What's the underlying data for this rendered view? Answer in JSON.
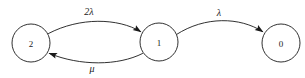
{
  "diagram": {
    "type": "state-transition-diagram",
    "title": "",
    "canvas": {
      "width": 305,
      "height": 78,
      "background": "#ffffff"
    },
    "stroke_color": "#1a1a1a",
    "nodes": [
      {
        "id": "state-2",
        "label": "2",
        "cx": 31,
        "cy": 43,
        "r": 19
      },
      {
        "id": "state-1",
        "label": "1",
        "cx": 159,
        "cy": 42,
        "r": 19
      },
      {
        "id": "state-0",
        "label": "0",
        "cx": 281,
        "cy": 43,
        "r": 19
      }
    ],
    "edges": [
      {
        "id": "edge-2-to-1",
        "from": "state-2",
        "to": "state-1",
        "label": "2λ",
        "label_x": 89,
        "label_y": 11,
        "curve": "arc-up",
        "path": "M 48.5 33.5 C 80 17, 118 18, 140.5 31.5",
        "arrow_x": 141.5,
        "arrow_y": 32.2,
        "arrow_angle": 35
      },
      {
        "id": "edge-1-to-2",
        "from": "state-1",
        "to": "state-2",
        "label": "μ",
        "label_x": 92,
        "label_y": 68,
        "curve": "arc-down",
        "path": "M 142.5 53.5 C 118 66, 80 66, 49.5 53.5",
        "arrow_x": 48.5,
        "arrow_y": 52.9,
        "arrow_angle": 202
      },
      {
        "id": "edge-1-to-0",
        "from": "state-1",
        "to": "state-0",
        "label": "λ",
        "label_x": 219,
        "label_y": 12,
        "curve": "arc-up",
        "path": "M 176.5 34.5 C 205 16, 240 17, 262.5 31.5",
        "arrow_x": 263.5,
        "arrow_y": 32.2,
        "arrow_angle": 36
      }
    ]
  }
}
